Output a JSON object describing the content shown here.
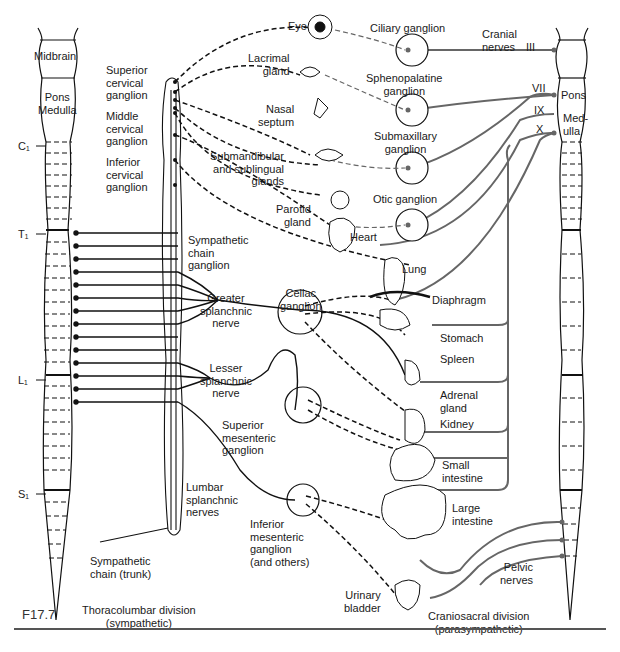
{
  "figure": {
    "id": "F17.7"
  },
  "colors": {
    "sympathetic": "#111111",
    "parasympathetic": "#6a6a6a",
    "ganglion_fill": "#ffffff"
  },
  "left_cord": {
    "labels": {
      "midbrain": "Midbrain",
      "pons_medulla": "Pons\nMedulla"
    },
    "segments": {
      "c1": "C₁",
      "t1": "T₁",
      "l1": "L₁",
      "s1": "S₁"
    }
  },
  "right_cord": {
    "labels": {
      "pons": "Pons",
      "medulla": "Med-\nulla"
    }
  },
  "cranial": {
    "title": "Cranial\nnerves",
    "nerves": {
      "iii": "III",
      "vii": "VII",
      "ix": "IX",
      "x": "X"
    }
  },
  "sympathetic_labels": {
    "superior_cervical": "Superior\ncervical\nganglion",
    "middle_cervical": "Middle\ncervical\nganglion",
    "inferior_cervical": "Inferior\ncervical\nganglion",
    "chain_ganglion": "Sympathetic\nchain\nganglion",
    "greater_splanchnic": "Greater\nsplanchnic\nnerve",
    "lesser_splanchnic": "Lesser\nsplanchnic\nnerve",
    "lumbar_splanchnic": "Lumbar\nsplanchnic\nnerves",
    "chain_trunk": "Sympathetic\nchain (trunk)",
    "celiac": "Celiac\nganglion",
    "superior_mesenteric": "Superior\nmesenteric\nganglion",
    "inferior_mesenteric": "Inferior\nmesenteric\nganglion\n(and others)"
  },
  "parasympathetic_ganglia": {
    "ciliary": "Ciliary ganglion",
    "sphenopalatine": "Sphenopalatine\nganglion",
    "submaxillary": "Submaxillary\nganglion",
    "otic": "Otic ganglion",
    "pelvic": "Pelvic\nnerves"
  },
  "organs": {
    "eye": "Eye",
    "lacrimal": "Lacrimal\ngland",
    "nasal": "Nasal\nseptum",
    "submandibular": "Submandibular\nand sublingual\nglands",
    "parotid": "Parotid\ngland",
    "heart": "Heart",
    "lung": "Lung",
    "diaphragm": "Diaphragm",
    "stomach": "Stomach",
    "spleen": "Spleen",
    "adrenal": "Adrenal\ngland",
    "kidney": "Kidney",
    "small_intestine": "Small\nintestine",
    "large_intestine": "Large\nintestine",
    "bladder": "Urinary\nbladder"
  },
  "divisions": {
    "thoracolumbar": "Thoracolumbar division\n(sympathetic)",
    "craniosacral": "Craniosacral division\n(parasympathetic)"
  }
}
